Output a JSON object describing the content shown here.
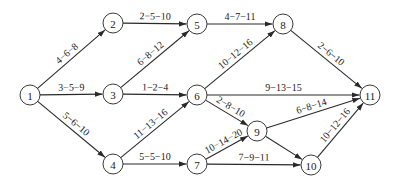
{
  "diagram": {
    "type": "activity-network",
    "node_radius": 10,
    "colors": {
      "stroke": "#2a2a2a",
      "text": "#222222",
      "background": "#ffffff"
    },
    "nodes": [
      {
        "id": "1",
        "label": "1",
        "x": 30,
        "y": 95
      },
      {
        "id": "2",
        "label": "2",
        "x": 113,
        "y": 23
      },
      {
        "id": "3",
        "label": "3",
        "x": 113,
        "y": 94
      },
      {
        "id": "4",
        "label": "4",
        "x": 113,
        "y": 164
      },
      {
        "id": "5",
        "label": "5",
        "x": 197,
        "y": 24
      },
      {
        "id": "6",
        "label": "6",
        "x": 197,
        "y": 95
      },
      {
        "id": "7",
        "label": "7",
        "x": 197,
        "y": 164
      },
      {
        "id": "8",
        "label": "8",
        "x": 283,
        "y": 24
      },
      {
        "id": "9",
        "label": "9",
        "x": 257,
        "y": 131
      },
      {
        "id": "10",
        "label": "10",
        "x": 311,
        "y": 165
      },
      {
        "id": "11",
        "label": "11",
        "x": 370,
        "y": 95
      }
    ],
    "edges": [
      {
        "from": "1",
        "to": "2",
        "label": "4−6−8"
      },
      {
        "from": "1",
        "to": "3",
        "label": "3−5−9"
      },
      {
        "from": "1",
        "to": "4",
        "label": "5−6−10"
      },
      {
        "from": "2",
        "to": "5",
        "label": "2−5−10"
      },
      {
        "from": "3",
        "to": "5",
        "label": "6−8−12"
      },
      {
        "from": "3",
        "to": "6",
        "label": "1−2−4"
      },
      {
        "from": "4",
        "to": "6",
        "label": "11−13−16"
      },
      {
        "from": "4",
        "to": "7",
        "label": "5−5−10"
      },
      {
        "from": "5",
        "to": "8",
        "label": "4−7−11"
      },
      {
        "from": "6",
        "to": "8",
        "label": "10−12−16"
      },
      {
        "from": "6",
        "to": "11",
        "label": "9−13−15"
      },
      {
        "from": "6",
        "to": "9",
        "label": "2−8−10"
      },
      {
        "from": "7",
        "to": "9",
        "label": "10−14−20"
      },
      {
        "from": "7",
        "to": "10",
        "label": "7−9−11"
      },
      {
        "from": "8",
        "to": "11",
        "label": "2−6−10"
      },
      {
        "from": "9",
        "to": "11",
        "label": "6−8−14"
      },
      {
        "from": "9",
        "to": "10",
        "label": ""
      },
      {
        "from": "10",
        "to": "11",
        "label": "10−12−16"
      }
    ]
  }
}
